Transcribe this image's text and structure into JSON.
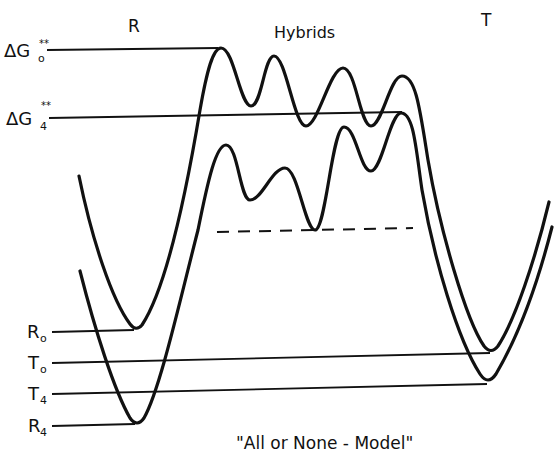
{
  "diagram": {
    "title": "\"All or None - Model\"",
    "state_labels": {
      "reactant": "R",
      "hybrids": "Hybrids",
      "transition": "T"
    },
    "energy_labels": {
      "dg0": {
        "main": "ΔG",
        "sub": "o",
        "sup": "**"
      },
      "dg4": {
        "main": "ΔG",
        "sub": "4",
        "sup": "**"
      },
      "r0": {
        "main": "R",
        "sub": "o"
      },
      "t0": {
        "main": "T",
        "sub": "o"
      },
      "t4": {
        "main": "T",
        "sub": "4"
      },
      "r4": {
        "main": "R",
        "sub": "4"
      }
    },
    "curves": [
      {
        "name": "state-0 free energy profile",
        "minima": [
          "R0",
          "T0"
        ],
        "barrier": "ΔG0**"
      },
      {
        "name": "state-4 free energy profile",
        "minima": [
          "R4",
          "T4"
        ],
        "barrier": "ΔG4**"
      }
    ],
    "dashed_line": "lowest hybrid intermediate level (state 4)",
    "colors": {
      "ink": "#111111",
      "background": "#ffffff"
    }
  }
}
